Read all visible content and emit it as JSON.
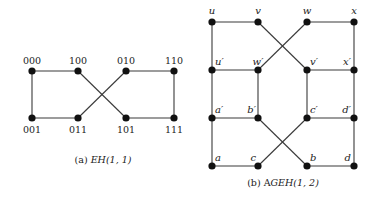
{
  "figure_a": {
    "caption_prefix": "(a) ",
    "caption_math": "EH(1, 1)",
    "nodes": {
      "n000": {
        "label": "000",
        "x": 32,
        "y": 71
      },
      "n100": {
        "label": "100",
        "x": 78,
        "y": 71
      },
      "n010": {
        "label": "010",
        "x": 126,
        "y": 71
      },
      "n110": {
        "label": "110",
        "x": 174,
        "y": 71
      },
      "n001": {
        "label": "001",
        "x": 32,
        "y": 118
      },
      "n011": {
        "label": "011",
        "x": 78,
        "y": 118
      },
      "n101": {
        "label": "101",
        "x": 126,
        "y": 118
      },
      "n111": {
        "label": "111",
        "x": 174,
        "y": 118
      }
    },
    "edges": [
      [
        "n000",
        "n100"
      ],
      [
        "n010",
        "n110"
      ],
      [
        "n001",
        "n011"
      ],
      [
        "n101",
        "n111"
      ],
      [
        "n000",
        "n001"
      ],
      [
        "n110",
        "n111"
      ],
      [
        "n100",
        "n101"
      ],
      [
        "n010",
        "n011"
      ]
    ]
  },
  "figure_b": {
    "caption_prefix": "(b) A",
    "caption_math": "GEH(1, 2)",
    "nodes": {
      "u": {
        "label": "u",
        "x": 212,
        "y": 22
      },
      "v": {
        "label": "v",
        "x": 258,
        "y": 22
      },
      "w": {
        "label": "w",
        "x": 307,
        "y": 22
      },
      "x": {
        "label": "x",
        "x": 354,
        "y": 22
      },
      "u2": {
        "label": "u′",
        "x": 212,
        "y": 70
      },
      "w2": {
        "label": "w′",
        "x": 258,
        "y": 70
      },
      "v2": {
        "label": "v′",
        "x": 307,
        "y": 70
      },
      "x2": {
        "label": "x′",
        "x": 354,
        "y": 70
      },
      "a2": {
        "label": "a′",
        "x": 212,
        "y": 118
      },
      "b2": {
        "label": "b′",
        "x": 258,
        "y": 118
      },
      "c2": {
        "label": "c′",
        "x": 307,
        "y": 118
      },
      "d2": {
        "label": "d′",
        "x": 354,
        "y": 118
      },
      "a": {
        "label": "a",
        "x": 212,
        "y": 166
      },
      "c": {
        "label": "c",
        "x": 258,
        "y": 166
      },
      "b": {
        "label": "b",
        "x": 307,
        "y": 166
      },
      "d": {
        "label": "d",
        "x": 354,
        "y": 166
      }
    },
    "edges": [
      [
        "u",
        "v"
      ],
      [
        "w",
        "x"
      ],
      [
        "u",
        "u2"
      ],
      [
        "x",
        "x2"
      ],
      [
        "v",
        "v2"
      ],
      [
        "w",
        "w2"
      ],
      [
        "u2",
        "w2"
      ],
      [
        "v2",
        "x2"
      ],
      [
        "u2",
        "a2"
      ],
      [
        "w2",
        "b2"
      ],
      [
        "v2",
        "c2"
      ],
      [
        "x2",
        "d2"
      ],
      [
        "a2",
        "b2"
      ],
      [
        "c2",
        "d2"
      ],
      [
        "a2",
        "a"
      ],
      [
        "d2",
        "d"
      ],
      [
        "b2",
        "b"
      ],
      [
        "c2",
        "c"
      ],
      [
        "a",
        "c"
      ],
      [
        "b",
        "d"
      ]
    ]
  }
}
